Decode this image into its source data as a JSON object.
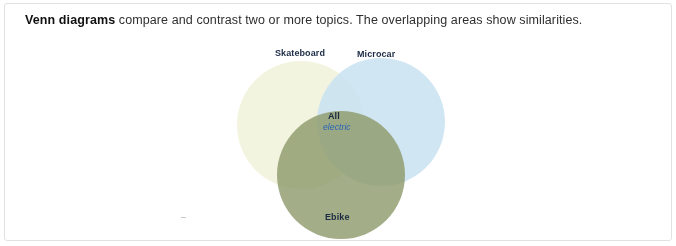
{
  "caption": {
    "lead": "Venn diagrams",
    "rest": " compare and contrast two or more topics. The overlapping areas show similarities."
  },
  "diagram": {
    "type": "venn",
    "sets": [
      {
        "name": "Skateboard",
        "label": "Skateboard",
        "color": "#f2f3dd"
      },
      {
        "name": "Microcar",
        "label": "Microcar",
        "color": "#cfe4f2"
      },
      {
        "name": "Ebike",
        "label": "Ebike",
        "color": "#9aa57a"
      }
    ],
    "intersection": {
      "label": "All",
      "sublabel": "electric",
      "sublabel_color": "#2a63b8"
    }
  }
}
